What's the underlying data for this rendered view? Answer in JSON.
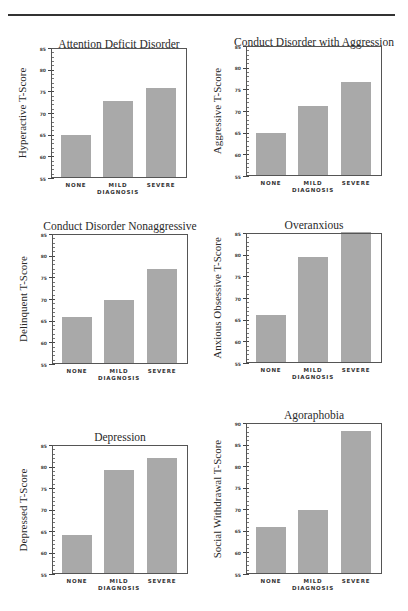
{
  "chart_data": [
    {
      "type": "bar",
      "title": "Attention Deficit Disorder",
      "xlabel": "DIAGNOSIS",
      "ylabel": "Hyperactive T-Score",
      "categories": [
        "NONE",
        "MILD",
        "SEVERE"
      ],
      "values": [
        65.0,
        72.7,
        75.7
      ],
      "ylim": [
        55,
        85
      ],
      "yticks": [
        55,
        60,
        65,
        70,
        75,
        80,
        85
      ],
      "grid": false,
      "layout": {
        "title_y": 38,
        "plot_x": 51,
        "plot_y": 48,
        "plot_w": 136,
        "plot_h": 130
      }
    },
    {
      "type": "bar",
      "title": "Conduct Disorder with Aggression",
      "xlabel": "DIAGNOSIS",
      "ylabel": "Aggressive T-Score",
      "categories": [
        "NONE",
        "MILD",
        "SEVERE"
      ],
      "values": [
        65.0,
        71.1,
        76.7
      ],
      "ylim": [
        55,
        85
      ],
      "yticks": [
        55,
        60,
        65,
        70,
        75,
        80,
        85
      ],
      "grid": false,
      "layout": {
        "title_y": 36,
        "plot_x": 246,
        "plot_y": 46,
        "plot_w": 136,
        "plot_h": 130
      }
    },
    {
      "type": "bar",
      "title": "Conduct Disorder Nonaggressive",
      "xlabel": "DIAGNOSIS",
      "ylabel": "Delinquent T-Score",
      "categories": [
        "NONE",
        "MILD",
        "SEVERE"
      ],
      "values": [
        65.8,
        69.8,
        76.9
      ],
      "ylim": [
        55,
        85
      ],
      "yticks": [
        55,
        60,
        65,
        70,
        75,
        80,
        85
      ],
      "grid": false,
      "layout": {
        "title_y": 220,
        "plot_x": 52,
        "plot_y": 234,
        "plot_w": 136,
        "plot_h": 130
      }
    },
    {
      "type": "bar",
      "title": "Overanxious",
      "xlabel": "DIAGNOSIS",
      "ylabel": "Anxious Obsessive T-Score",
      "categories": [
        "NONE",
        "MILD",
        "SEVERE"
      ],
      "values": [
        66.0,
        79.4,
        85.3
      ],
      "ylim": [
        55,
        85
      ],
      "yticks": [
        55,
        60,
        65,
        70,
        75,
        80,
        85
      ],
      "grid": false,
      "layout": {
        "title_y": 219,
        "plot_x": 246,
        "plot_y": 233,
        "plot_w": 136,
        "plot_h": 130
      }
    },
    {
      "type": "bar",
      "title": "Depression",
      "xlabel": "DIAGNOSIS",
      "ylabel": "Depressed T-Score",
      "categories": [
        "NONE",
        "MILD",
        "SEVERE"
      ],
      "values": [
        64.1,
        79.2,
        82.0
      ],
      "ylim": [
        55,
        85
      ],
      "yticks": [
        55,
        60,
        65,
        70,
        75,
        80,
        85
      ],
      "grid": false,
      "layout": {
        "title_y": 431,
        "plot_x": 52,
        "plot_y": 445,
        "plot_w": 136,
        "plot_h": 129
      }
    },
    {
      "type": "bar",
      "title": "Agoraphobia",
      "xlabel": "DIAGNOSIS",
      "ylabel": "Social Withdrawal T-Score",
      "categories": [
        "NONE",
        "MILD",
        "SEVERE"
      ],
      "values": [
        65.8,
        69.9,
        88.2
      ],
      "ylim": [
        55,
        90
      ],
      "yticks": [
        55,
        60,
        65,
        70,
        75,
        80,
        85,
        90
      ],
      "grid": false,
      "layout": {
        "title_y": 409,
        "plot_x": 246,
        "plot_y": 423,
        "plot_w": 136,
        "plot_h": 151
      }
    }
  ],
  "colors": {
    "bar": "#a9a9a9",
    "axis": "#555555",
    "background": "#ffffff"
  }
}
